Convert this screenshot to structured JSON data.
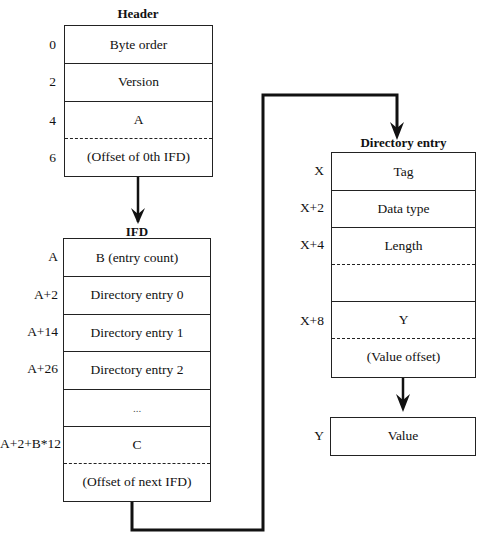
{
  "header": {
    "title": "Header",
    "rows": [
      {
        "offset": "0",
        "label": "Byte order"
      },
      {
        "offset": "2",
        "label": "Version"
      },
      {
        "offset": "4",
        "label": "A"
      },
      {
        "offset": "6",
        "label": "(Offset of 0th IFD)"
      }
    ]
  },
  "ifd": {
    "title": "IFD",
    "rows": [
      {
        "offset": "A",
        "label": "B  (entry count)"
      },
      {
        "offset": "A+2",
        "label": "Directory entry 0"
      },
      {
        "offset": "A+14",
        "label": "Directory entry 1"
      },
      {
        "offset": "A+26",
        "label": "Directory entry 2"
      },
      {
        "offset": "",
        "label": "..."
      },
      {
        "offset": "A+2+B*12",
        "label": "C"
      },
      {
        "offset": "",
        "label": "(Offset of next IFD)"
      }
    ]
  },
  "directory_entry": {
    "title": "Directory entry",
    "rows": [
      {
        "offset": "X",
        "label": "Tag"
      },
      {
        "offset": "X+2",
        "label": "Data type"
      },
      {
        "offset": "X+4",
        "label": "Length"
      },
      {
        "offset": "",
        "label": ""
      },
      {
        "offset": "X+8",
        "label": "Y"
      },
      {
        "offset": "",
        "label": "(Value offset)"
      }
    ]
  },
  "value_box": {
    "offset": "Y",
    "label": "Value"
  }
}
